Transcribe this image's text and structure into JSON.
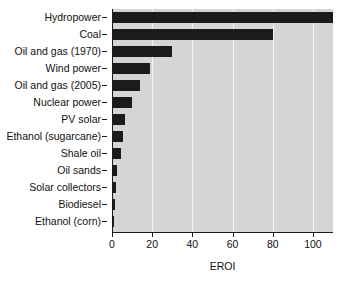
{
  "chart_data": {
    "type": "bar",
    "orientation": "horizontal",
    "title": "",
    "xlabel": "EROI",
    "ylabel": "",
    "xlim": [
      0,
      110
    ],
    "ylim": null,
    "grid": true,
    "gridlines_axis": "x",
    "legend": null,
    "xticks": [
      0,
      20,
      40,
      60,
      80,
      100
    ],
    "xtick_labels": [
      "0",
      "20",
      "40",
      "60",
      "80",
      "100"
    ],
    "categories": [
      "Hydropower",
      "Coal",
      "Oil and gas (1970)",
      "Wind power",
      "Oil and gas (2005)",
      "Nuclear power",
      "PV solar",
      "Ethanol (sugarcane)",
      "Shale oil",
      "Oil sands",
      "Solar collectors",
      "Biodiesel",
      "Ethanol (corn)"
    ],
    "values": [
      110,
      80,
      30,
      19,
      14,
      10,
      6.5,
      5.5,
      4.5,
      2.7,
      1.8,
      1.3,
      1.2
    ],
    "colors": {
      "bar": "#1b1b1b",
      "plot_background": "#d5d5d5",
      "gridline": "#f4f4f4",
      "axis": "#1a1a1a",
      "text": "#111111",
      "figure_background": "#ffffff"
    }
  }
}
